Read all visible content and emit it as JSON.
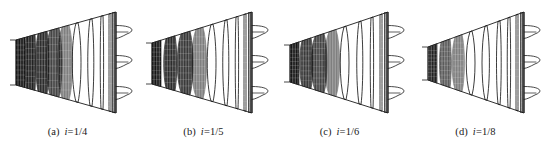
{
  "figure": {
    "type": "technical-line-drawing",
    "background_color": "#ffffff",
    "ink_color": "#1a1a1a",
    "fill_color": "#0d0d0d",
    "panel_count": 4
  },
  "panels": [
    {
      "id": "a",
      "tag": "(a)",
      "symbol": "i",
      "equals": "=",
      "value": "1/4",
      "caption": "(a)  i=1/4",
      "taper_ratio": 0.25,
      "left_x": 16,
      "right_x": 116,
      "left_top_y": 40,
      "left_bottom_y": 85,
      "right_top_y": 12,
      "right_bottom_y": 113,
      "stations": [
        {
          "x": 16,
          "filled": true,
          "fill_density": 1.0,
          "bulge": 0
        },
        {
          "x": 26,
          "filled": true,
          "fill_density": 0.95,
          "bulge": 1
        },
        {
          "x": 38,
          "filled": true,
          "fill_density": 0.9,
          "bulge": 3
        },
        {
          "x": 50,
          "filled": true,
          "fill_density": 0.8,
          "bulge": 5
        },
        {
          "x": 62,
          "filled": true,
          "fill_density": 0.55,
          "bulge": 6
        },
        {
          "x": 76,
          "filled": false,
          "fill_density": 0.18,
          "bulge": 5
        },
        {
          "x": 90,
          "filled": false,
          "fill_density": 0.08,
          "bulge": 3
        },
        {
          "x": 101,
          "filled": false,
          "fill_density": 0.05,
          "bulge": 1
        },
        {
          "x": 109,
          "filled": false,
          "fill_density": 0.03,
          "bulge": 0
        },
        {
          "x": 113,
          "filled": false,
          "fill_density": 0.02,
          "bulge": 0
        }
      ],
      "outlet_profiles": [
        {
          "y": 32,
          "length": 20,
          "height": 13
        },
        {
          "y": 62,
          "length": 20,
          "height": 13
        },
        {
          "y": 93,
          "length": 20,
          "height": 13
        }
      ]
    },
    {
      "id": "b",
      "tag": "(b)",
      "symbol": "i",
      "equals": "=",
      "value": "1/5",
      "caption": "(b)  i=1/5",
      "taper_ratio": 0.2,
      "left_x": 16,
      "right_x": 116,
      "left_top_y": 43,
      "left_bottom_y": 84,
      "right_top_y": 12,
      "right_bottom_y": 113,
      "stations": [
        {
          "x": 16,
          "filled": true,
          "fill_density": 1.0,
          "bulge": 0
        },
        {
          "x": 30,
          "filled": true,
          "fill_density": 0.9,
          "bulge": 3
        },
        {
          "x": 45,
          "filled": true,
          "fill_density": 0.85,
          "bulge": 5
        },
        {
          "x": 60,
          "filled": true,
          "fill_density": 0.5,
          "bulge": 6
        },
        {
          "x": 75,
          "filled": false,
          "fill_density": 0.15,
          "bulge": 5
        },
        {
          "x": 89,
          "filled": false,
          "fill_density": 0.07,
          "bulge": 3
        },
        {
          "x": 100,
          "filled": false,
          "fill_density": 0.05,
          "bulge": 1
        },
        {
          "x": 108,
          "filled": false,
          "fill_density": 0.03,
          "bulge": 0
        },
        {
          "x": 113,
          "filled": false,
          "fill_density": 0.02,
          "bulge": 0
        }
      ],
      "outlet_profiles": [
        {
          "y": 32,
          "length": 20,
          "height": 13
        },
        {
          "y": 62,
          "length": 20,
          "height": 13
        },
        {
          "y": 93,
          "length": 20,
          "height": 13
        }
      ]
    },
    {
      "id": "c",
      "tag": "(c)",
      "symbol": "i",
      "equals": "=",
      "value": "1/6",
      "caption": "(c)  i=1/6",
      "taper_ratio": 0.1667,
      "left_x": 18,
      "right_x": 116,
      "left_top_y": 45,
      "left_bottom_y": 82,
      "right_top_y": 12,
      "right_bottom_y": 113,
      "stations": [
        {
          "x": 18,
          "filled": true,
          "fill_density": 1.0,
          "bulge": 0
        },
        {
          "x": 30,
          "filled": true,
          "fill_density": 0.85,
          "bulge": 3
        },
        {
          "x": 43,
          "filled": true,
          "fill_density": 0.8,
          "bulge": 5
        },
        {
          "x": 57,
          "filled": true,
          "fill_density": 0.4,
          "bulge": 6
        },
        {
          "x": 72,
          "filled": false,
          "fill_density": 0.12,
          "bulge": 5
        },
        {
          "x": 87,
          "filled": false,
          "fill_density": 0.06,
          "bulge": 3
        },
        {
          "x": 99,
          "filled": false,
          "fill_density": 0.04,
          "bulge": 1
        },
        {
          "x": 108,
          "filled": false,
          "fill_density": 0.03,
          "bulge": 0
        },
        {
          "x": 113,
          "filled": false,
          "fill_density": 0.02,
          "bulge": 0
        }
      ],
      "outlet_profiles": [
        {
          "y": 32,
          "length": 20,
          "height": 13
        },
        {
          "y": 62,
          "length": 20,
          "height": 13
        },
        {
          "y": 93,
          "length": 20,
          "height": 13
        }
      ]
    },
    {
      "id": "d",
      "tag": "(d)",
      "symbol": "i",
      "equals": "=",
      "value": "1/8",
      "caption": "(d)  i=1/8",
      "taper_ratio": 0.125,
      "left_x": 20,
      "right_x": 116,
      "left_top_y": 47,
      "left_bottom_y": 80,
      "right_top_y": 12,
      "right_bottom_y": 113,
      "stations": [
        {
          "x": 20,
          "filled": true,
          "fill_density": 0.95,
          "bulge": 0
        },
        {
          "x": 33,
          "filled": true,
          "fill_density": 0.7,
          "bulge": 2
        },
        {
          "x": 47,
          "filled": true,
          "fill_density": 0.55,
          "bulge": 4
        },
        {
          "x": 62,
          "filled": false,
          "fill_density": 0.18,
          "bulge": 5
        },
        {
          "x": 77,
          "filled": false,
          "fill_density": 0.09,
          "bulge": 4
        },
        {
          "x": 90,
          "filled": false,
          "fill_density": 0.05,
          "bulge": 2
        },
        {
          "x": 100,
          "filled": false,
          "fill_density": 0.04,
          "bulge": 1
        },
        {
          "x": 108,
          "filled": false,
          "fill_density": 0.03,
          "bulge": 0
        },
        {
          "x": 113,
          "filled": false,
          "fill_density": 0.02,
          "bulge": 0
        }
      ],
      "outlet_profiles": [
        {
          "y": 32,
          "length": 20,
          "height": 13
        },
        {
          "y": 62,
          "length": 20,
          "height": 13
        },
        {
          "y": 93,
          "length": 20,
          "height": 13
        }
      ]
    }
  ],
  "panel_origins": [
    0,
    136,
    272,
    408
  ]
}
